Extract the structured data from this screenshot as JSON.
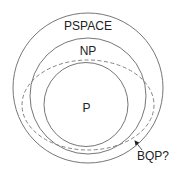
{
  "diagram": {
    "colors": {
      "stroke": "#555555",
      "text": "#222222",
      "background": "#ffffff"
    },
    "sets": [
      {
        "id": "pspace",
        "label": "PSPACE",
        "shape": "circle",
        "style": "solid"
      },
      {
        "id": "np",
        "label": "NP",
        "shape": "circle",
        "style": "solid"
      },
      {
        "id": "p",
        "label": "P",
        "shape": "circle",
        "style": "solid"
      },
      {
        "id": "bqp",
        "label": "BQP?",
        "shape": "ellipse",
        "style": "dashed"
      }
    ],
    "labels": {
      "pspace": "PSPACE",
      "np": "NP",
      "p": "P",
      "bqp": "BQP?"
    }
  }
}
